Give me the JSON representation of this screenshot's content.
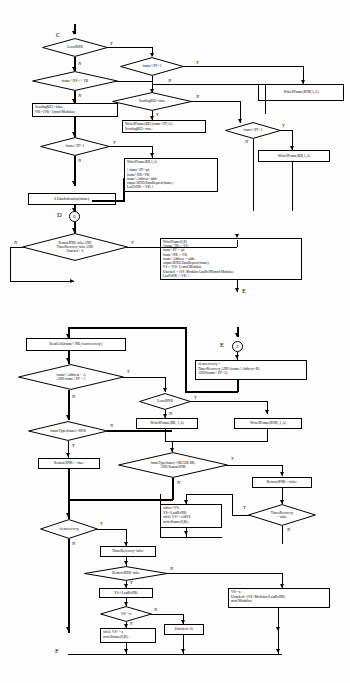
{
  "diagram": {
    "type": "flowchart"
  },
  "top_panel": {
    "connectors": [
      {
        "id": "C",
        "label": "C"
      },
      {
        "id": "D",
        "label": "D",
        "circle": "D"
      },
      {
        "id": "E",
        "label": "E",
        "circle": "E"
      }
    ],
    "decisions": [
      {
        "id": "d-localrnr",
        "text": "LocalRNR"
      },
      {
        "id": "d-nsvr",
        "text": "frame^.NS <> VR"
      },
      {
        "id": "d-pf1-left",
        "text": "frame^.PF=1"
      },
      {
        "id": "d-pf1-top",
        "text": "frame^.PF=1"
      },
      {
        "id": "d-sendingrej",
        "text": "SendingREJ=false"
      },
      {
        "id": "d-pf1-mid",
        "text": "frame^.PF=1"
      },
      {
        "id": "d-remote",
        "text": "RemoteRNR=false AND\nTimerRecovery=false AND\nUnacked < k"
      }
    ],
    "processes": [
      {
        "id": "p-sendingrej",
        "text": "SendingREJ:=false;\nVR:=(VR+1)mod Modulus;"
      },
      {
        "id": "p-writerej",
        "text": "WriteSFrame(REJ,frame^.PF,A);\nSendingREJ:=true;"
      },
      {
        "id": "p-writerr-1",
        "text": "WriteSFrame(RR,1,A)\n\n{ frame^.PF:=pf;\n  frame^.NR:=VR;\n  frame^.Address:=addr;\n  output SEND.DataRequest(frame);\n  LastTxNR := VR;            }"
      },
      {
        "id": "p-dataind",
        "text": "S.DataIndication(frame);"
      },
      {
        "id": "p-writernr-1",
        "text": "WriteSFrame(RNR,1,A)"
      },
      {
        "id": "p-writerr-2",
        "text": "WriteSFrame(RR,1,A)"
      },
      {
        "id": "p-writeframe",
        "text": "WriteIFrame(0,B)\n{frame^.NS := VS;\n frame^.PF := pf;\n frame^.NR := VR;\n frame^.Address := addr;\n output SEND.DataRequest(frame);\n VS := (VS+1) mod Modulus;\n Unacked := (VS+Modulus-LastRxNR)mod Modulus;\n LastTxNR := VR;   }"
      }
    ],
    "edge_labels": {
      "localrnr_y": "Y",
      "localrnr_n": "N",
      "nsvr_y": "Y",
      "nsvr_n": "N",
      "pf1top_y": "Y",
      "pf1top_n": "N",
      "sendingrej_y": "Y",
      "sendingrej_n": "N",
      "pf1mid_y": "Y",
      "pf1mid_n": "N",
      "pf1left_y": "Y",
      "pf1left_n": "N",
      "remote_y": "Y",
      "remote_n": "N"
    }
  },
  "bottom_panel": {
    "connectors": [
      {
        "id": "E2",
        "label": "E",
        "circle": "E"
      },
      {
        "id": "F",
        "label": "F"
      }
    ],
    "decisions": [
      {
        "id": "d-addr",
        "text": "frame^.Address = A\nAND frame^.PF = 1"
      },
      {
        "id": "d-localrnr2",
        "text": "LocalRNR"
      },
      {
        "id": "d-ftype-rnr",
        "text": "frameType(frame)=RNR"
      },
      {
        "id": "d-ftype-rej",
        "text": "frameType(frame)=(REJ OR RR)\nAND RemoteRNR"
      },
      {
        "id": "d-clearrec",
        "text": "clearrecovery"
      },
      {
        "id": "d-timerrec",
        "text": "TimerRecovery\n= false"
      },
      {
        "id": "d-remoternr",
        "text": "RemoteRNR=false"
      },
      {
        "id": "d-vsx",
        "text": "VS<>x"
      }
    ],
    "processes": [
      {
        "id": "p-readack",
        "text": "ReadAck(frame^.NR,clearrecovery);"
      },
      {
        "id": "p-clearrec",
        "text": "clearrecovery:=\nTimerRecovery AND (frame^.Address=B)\nAND(frame^.PF=1);"
      },
      {
        "id": "p-writerr-b",
        "text": "WriteSFrame(RR, 1,A)"
      },
      {
        "id": "p-writernr-b",
        "text": "WriteSFrame(RNR, 1,A)"
      },
      {
        "id": "p-rnrtrue",
        "text": "RemoteRNR := true;"
      },
      {
        "id": "p-rnrfalse",
        "text": "RemoteRNR :=false;"
      },
      {
        "id": "p-oldvs",
        "text": "oldvs:=VS;\nVS:=LastRxNR;\nwhile VS<> oldVS\n  writeIframe(0,B);"
      },
      {
        "id": "p-timerfalse",
        "text": "TimerRecovery=false;"
      },
      {
        "id": "p-vslast",
        "text": "VS:=LastRxNR;"
      },
      {
        "id": "p-whilevs",
        "text": "while VS<> x\n  writeIframe(0,B);"
      },
      {
        "id": "p-unacked0",
        "text": "Unacked:=0;"
      },
      {
        "id": "p-vsx",
        "text": "VS:=x;\nUnacked:=(VS+Modulus-LastRxNR)\nmod Modulus;"
      }
    ],
    "edge_labels": {
      "addr_y": "Y",
      "addr_n": "N",
      "localrnr2_y": "Y",
      "localrnr2_n": "N",
      "ftypernr_y": "Y",
      "ftypernr_n": "N",
      "ftyperej_y": "Y",
      "ftyperej_n": "N",
      "clearrec_y": "Y",
      "clearrec_n": "N",
      "timerrec_y": "Y",
      "timerrec_n": "N",
      "remoternr_y": "Y",
      "remoternr_n": "N",
      "vsx_y": "Y",
      "vsx_n": "N"
    }
  },
  "colors": {
    "ink": "#000000",
    "paper": "#fdfdfd"
  }
}
